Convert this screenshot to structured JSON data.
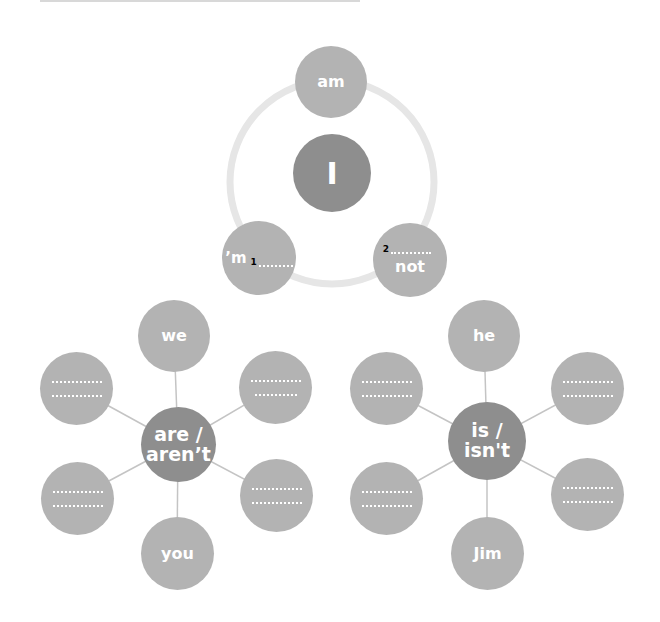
{
  "colors": {
    "satellite": "#b3b3b3",
    "center": "#8e8e8e",
    "ring": "#e6e6e6",
    "link": "#c4c4c4",
    "text": "#ffffff",
    "number": "#000000"
  },
  "top_cluster": {
    "center": {
      "label": "I"
    },
    "nodes": [
      {
        "id": "am",
        "label": "am"
      },
      {
        "id": "contraction",
        "prefix": "’m",
        "number": "1",
        "blank": "…………"
      },
      {
        "id": "not",
        "number": "2",
        "blank": "…………",
        "suffix": "not"
      }
    ]
  },
  "left_cluster": {
    "center": {
      "line1": "are /",
      "line2": "aren’t"
    },
    "nodes": [
      {
        "position": "top",
        "label": "we"
      },
      {
        "position": "top-left",
        "blank1": "…………",
        "blank2": "…………"
      },
      {
        "position": "top-right",
        "blank1": "…………",
        "blank2": "…………"
      },
      {
        "position": "bottom-left",
        "blank1": "…………",
        "blank2": "…………"
      },
      {
        "position": "bottom-right",
        "blank1": "…………",
        "blank2": "…………"
      },
      {
        "position": "bottom",
        "label": "you"
      }
    ]
  },
  "right_cluster": {
    "center": {
      "line1": "is /",
      "line2": "isn't"
    },
    "nodes": [
      {
        "position": "top",
        "label": "he"
      },
      {
        "position": "top-left",
        "blank1": "…………",
        "blank2": "…………"
      },
      {
        "position": "top-right",
        "blank1": "…………",
        "blank2": "…………"
      },
      {
        "position": "bottom-left",
        "blank1": "…………",
        "blank2": "…………"
      },
      {
        "position": "bottom-right",
        "blank1": "…………",
        "blank2": "…………"
      },
      {
        "position": "bottom",
        "label": "Jim"
      }
    ]
  }
}
